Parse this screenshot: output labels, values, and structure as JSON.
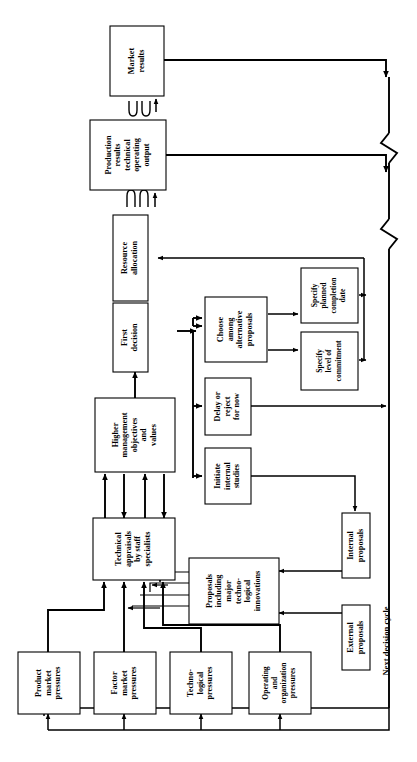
{
  "figure": {
    "orientation": "rotated-90-ccw",
    "caption_label": "Next decision cycle",
    "colors": {
      "stroke": "#000000",
      "fill": "#ffffff",
      "background": "#ffffff"
    }
  },
  "nodes": {
    "market_results": "Market\nresults",
    "production_results": "Production\nresults\ntechnical\noperating\noutput",
    "resource_allocation": "Resource\nallocation",
    "first_decision": "First\ndecision",
    "choose_among": "Choose\namong\nalternative\nproposals",
    "specify_planned": "Specify\nplanned\ncompletion\ndate",
    "specify_level": "Specify\nlevel of\ncommitment",
    "delay_or_reject": "Delay or\nreject\nfor now",
    "initiate_internal": "Initiate\ninternal\nstudies",
    "higher_management": "Higher\nmanagement\nobjectives\nand\nvalues",
    "technical_appraisals": "Technical\nappraisals\nby staff\nspecialists",
    "proposals_including": "Proposals\nincluding\nmajor\ntechno-\nlogical\ninnovations",
    "internal_proposals": "Internal\nproposals",
    "external_proposals": "External\nproposals",
    "product_market": "Product\nmarket\npressures",
    "factor_market": "Factor\nmarket\npressures",
    "technological": "Techno-\nlogical\npressures",
    "operating_org": "Operating\nand\norganization\npressures"
  },
  "node_lines": {
    "market_results": [
      "Market",
      "results"
    ],
    "production_results": [
      "Production",
      "results",
      "technical",
      "operating",
      "output"
    ],
    "resource_allocation": [
      "Resource",
      "allocation"
    ],
    "first_decision": [
      "First",
      "decision"
    ],
    "choose_among": [
      "Choose",
      "among",
      "alternative",
      "proposals"
    ],
    "specify_planned": [
      "Specify",
      "planned",
      "completion",
      "date"
    ],
    "specify_level": [
      "Specify",
      "level of",
      "commitment"
    ],
    "delay_or_reject": [
      "Delay or",
      "reject",
      "for now"
    ],
    "initiate_internal": [
      "Initiate",
      "internal",
      "studies"
    ],
    "higher_management": [
      "Higher",
      "management",
      "objectives",
      "and",
      "values"
    ],
    "technical_appraisals": [
      "Technical",
      "appraisals",
      "by staff",
      "specialists"
    ],
    "proposals_including": [
      "Proposals",
      "including",
      "major",
      "techno-",
      "logical",
      "innovations"
    ],
    "internal_proposals": [
      "Internal",
      "proposals"
    ],
    "external_proposals": [
      "External",
      "proposals"
    ],
    "product_market": [
      "Product",
      "market",
      "pressures"
    ],
    "factor_market": [
      "Factor",
      "market",
      "pressures"
    ],
    "technological": [
      "Techno-",
      "logical",
      "pressures"
    ],
    "operating_org": [
      "Operating",
      "and",
      "organization",
      "pressures"
    ]
  }
}
